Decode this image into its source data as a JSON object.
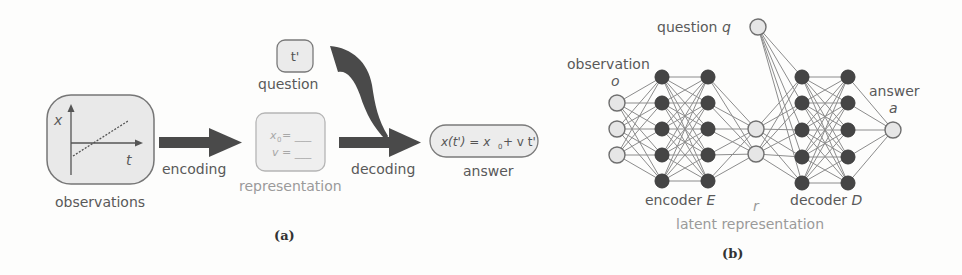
{
  "panel_a": {
    "caption": "(a)",
    "observations": {
      "label": "observations",
      "axis_y_label": "x",
      "axis_x_label": "t"
    },
    "encoding_label": "encoding",
    "representation": {
      "label": "representation",
      "line1_var": "x",
      "line1_sub": "0",
      "line1_eq": " = ___",
      "line2": "v = ___"
    },
    "question": {
      "value": "t'",
      "label": "question"
    },
    "decoding_label": "decoding",
    "answer": {
      "eq_part1": "x(t') = x",
      "eq_sub": "0",
      "eq_part2": " + v t'",
      "label": "answer"
    }
  },
  "panel_b": {
    "caption": "(b)",
    "observation_label": "observation",
    "observation_symbol": "o",
    "question_label": "question ",
    "question_symbol": "q",
    "answer_label": "answer",
    "answer_symbol": "a",
    "encoder_label": "encoder ",
    "encoder_symbol": "E",
    "decoder_label": "decoder ",
    "decoder_symbol": "D",
    "latent_symbol": "r",
    "latent_label": "latent representation",
    "layers": {
      "input": {
        "x": 617,
        "ys": [
          103,
          129,
          155
        ],
        "type": "light"
      },
      "enc1": {
        "x": 662,
        "ys": [
          77,
          103,
          129,
          155,
          181
        ],
        "type": "dark"
      },
      "enc2": {
        "x": 708,
        "ys": [
          77,
          103,
          129,
          155,
          181
        ],
        "type": "dark"
      },
      "latent": {
        "x": 756,
        "ys": [
          129,
          154
        ],
        "type": "light"
      },
      "dec1": {
        "x": 802,
        "ys": [
          77,
          103,
          130,
          157,
          183
        ],
        "type": "dark"
      },
      "dec2": {
        "x": 848,
        "ys": [
          77,
          103,
          130,
          157,
          183
        ],
        "type": "dark"
      },
      "output": {
        "x": 893,
        "ys": [
          130
        ],
        "type": "light"
      },
      "question": {
        "x": 758,
        "ys": [
          27
        ],
        "type": "light"
      }
    }
  },
  "colors": {
    "arrow": "#4a4a4a",
    "box_fill": "#ececec",
    "box_stroke": "#7a7a7a",
    "dark_node": "#454545",
    "light_node": "#e6e6e6",
    "edge": "#8c8c8c"
  }
}
